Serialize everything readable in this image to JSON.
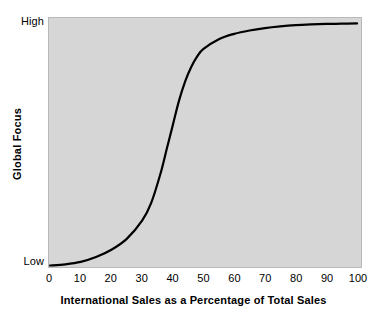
{
  "chart_data": {
    "type": "line",
    "title": "",
    "subtitle": "",
    "xlabel": "International Sales as a Percentage of Total Sales",
    "ylabel": "Global Focus",
    "xlim": [
      0,
      100
    ],
    "ylim": [
      0,
      1
    ],
    "grid": false,
    "legend": null,
    "x_ticks": [
      "0",
      "10",
      "20",
      "30",
      "40",
      "50",
      "60",
      "70",
      "80",
      "90",
      "100"
    ],
    "x_tick_values": [
      0,
      10,
      20,
      30,
      40,
      50,
      60,
      70,
      80,
      90,
      100
    ],
    "y_ticks": [
      "High",
      "Low"
    ],
    "y_tick_values": [
      1,
      0
    ],
    "series": [
      {
        "name": "Global Focus vs International Sales",
        "shape": "sigmoid",
        "color": "#000000",
        "line_width": 2,
        "x": [
          0,
          5,
          10,
          15,
          20,
          25,
          30,
          33,
          36,
          38,
          40,
          42,
          44,
          46,
          48,
          50,
          55,
          60,
          65,
          70,
          75,
          80,
          85,
          90,
          95,
          100
        ],
        "y": [
          0.0,
          0.005,
          0.015,
          0.035,
          0.065,
          0.11,
          0.185,
          0.26,
          0.38,
          0.48,
          0.58,
          0.68,
          0.76,
          0.82,
          0.865,
          0.895,
          0.935,
          0.957,
          0.971,
          0.981,
          0.988,
          0.993,
          0.996,
          0.998,
          0.999,
          1.0
        ]
      }
    ],
    "annotations": [],
    "plot_background": "#d6d6d6",
    "figure_background": "#ffffff"
  },
  "axes": {
    "y": {
      "title": "Global Focus",
      "tick_high": "High",
      "tick_low": "Low"
    },
    "x": {
      "title": "International Sales as a Percentage of Total Sales",
      "ticks": [
        {
          "label": "0",
          "value": 0
        },
        {
          "label": "10",
          "value": 10
        },
        {
          "label": "20",
          "value": 20
        },
        {
          "label": "30",
          "value": 30
        },
        {
          "label": "40",
          "value": 40
        },
        {
          "label": "50",
          "value": 50
        },
        {
          "label": "60",
          "value": 60
        },
        {
          "label": "70",
          "value": 70
        },
        {
          "label": "80",
          "value": 80
        },
        {
          "label": "90",
          "value": 90
        },
        {
          "label": "100",
          "value": 100
        }
      ]
    }
  },
  "colors": {
    "curve": "#000000",
    "plot_background": "#d6d6d6",
    "plot_border": "#b9b9b9",
    "text": "#000000",
    "figure_background": "#ffffff"
  }
}
